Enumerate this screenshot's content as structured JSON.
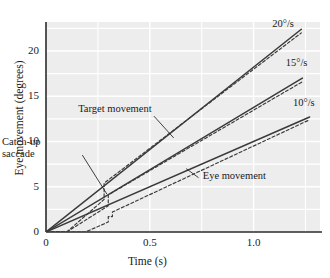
{
  "chart_data": {
    "type": "line",
    "title": "",
    "xlabel": "Time (s)",
    "ylabel": "Eye movement (degrees)",
    "xlim": [
      0,
      1.32
    ],
    "ylim": [
      0,
      23.2
    ],
    "xticks": [
      0,
      0.5,
      1.0
    ],
    "xtick_labels": [
      "0",
      "0.5",
      "1.0"
    ],
    "yticks": [
      0,
      5,
      10,
      15,
      20
    ],
    "ytick_labels": [
      "0",
      "5",
      "10",
      "15",
      "20"
    ],
    "grid": true,
    "grid_color": "#ffffff",
    "plot_background": "#ededed",
    "legend_position": "inline-right-end-of-line",
    "line_color": "#3a3a3a",
    "series": [
      {
        "name": "Target movement 20°/s",
        "label": "20°/s",
        "style": "solid",
        "velocity_deg_per_s": 20,
        "x": [
          0,
          1.23
        ],
        "values": [
          0,
          22.4
        ]
      },
      {
        "name": "Eye movement 20°/s",
        "style": "dashed",
        "velocity_deg_per_s": 20,
        "x": [
          0,
          0.1,
          0.28,
          0.28,
          1.23
        ],
        "values": [
          0,
          0,
          3.6,
          5.4,
          22.0
        ]
      },
      {
        "name": "Target movement 15°/s",
        "label": "15°/s",
        "style": "solid",
        "velocity_deg_per_s": 15,
        "x": [
          0,
          1.235
        ],
        "values": [
          0,
          17.0
        ]
      },
      {
        "name": "Eye movement 15°/s",
        "style": "dashed",
        "velocity_deg_per_s": 15,
        "x": [
          0,
          0.1,
          0.3,
          0.3,
          1.235
        ],
        "values": [
          0,
          0,
          2.9,
          4.1,
          16.6
        ]
      },
      {
        "name": "Target movement 10°/s",
        "label": "10°/s",
        "style": "solid",
        "velocity_deg_per_s": 10,
        "x": [
          0,
          1.27
        ],
        "values": [
          0,
          12.7
        ]
      },
      {
        "name": "Eye movement 10°/s",
        "style": "dashed",
        "velocity_deg_per_s": 10,
        "x": [
          0,
          0.19,
          0.3,
          0.3,
          0.32,
          0.32,
          1.27
        ],
        "values": [
          0,
          0,
          1.1,
          1.7,
          1.7,
          2.2,
          12.4
        ]
      }
    ],
    "annotations": [
      {
        "name": "target-movement",
        "text": "Target movement",
        "text_x": 0.155,
        "text_y": 13.6,
        "leader_from": [
          0.52,
          12.8
        ],
        "leader_to": [
          0.615,
          10.4
        ]
      },
      {
        "name": "catch-up-saccade",
        "text_line1": "Catch-up",
        "text_line2": "saccade",
        "text_x": 0.02,
        "text_y": 9.9,
        "leader_from": [
          0.175,
          8.5
        ],
        "leader_to": [
          0.293,
          4.2
        ]
      },
      {
        "name": "eye-movement",
        "text": "Eye movement",
        "text_x": 0.755,
        "text_y": 6.2,
        "leader_from": [
          0.735,
          6.0
        ],
        "leader_to": [
          0.675,
          7.0
        ]
      }
    ],
    "series_labels": [
      {
        "text": "20°/s",
        "x": 1.09,
        "y": 23.0
      },
      {
        "text": "15°/s",
        "x": 1.155,
        "y": 18.7
      },
      {
        "text": "10°/s",
        "x": 1.19,
        "y": 14.2
      }
    ]
  }
}
